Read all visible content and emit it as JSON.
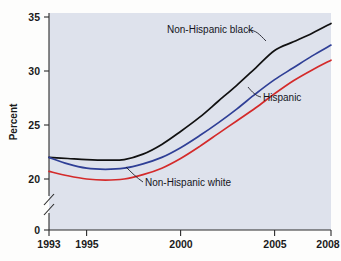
{
  "chart_data": {
    "type": "line",
    "title": "",
    "subtitle": "",
    "xlabel": "",
    "ylabel": "Percent",
    "x": [
      1993,
      1994,
      1995,
      1996,
      1997,
      1998,
      1999,
      2000,
      2001,
      2002,
      2003,
      2004,
      2005,
      2006,
      2007,
      2008
    ],
    "xlim": [
      1993,
      2008
    ],
    "ylim": [
      19.2,
      35
    ],
    "y_ticks": [
      0,
      20,
      25,
      30,
      35
    ],
    "y_tick_labels": [
      "0",
      "20",
      "25",
      "30",
      "35"
    ],
    "x_ticks": [
      1993,
      1995,
      2000,
      2005,
      2008
    ],
    "x_tick_labels": [
      "1993",
      "1995",
      "2000",
      "2005",
      "2008"
    ],
    "axis_break": true,
    "axis_break_note": "y-axis broken between 0 and 20",
    "grid": false,
    "legend_position": "inline-annotations",
    "series": [
      {
        "name": "Non-Hispanic black",
        "color": "#111111",
        "values": [
          22.0,
          21.9,
          21.8,
          21.75,
          21.8,
          22.3,
          23.2,
          24.4,
          25.7,
          27.2,
          28.7,
          30.3,
          31.9,
          32.7,
          33.5,
          34.4
        ]
      },
      {
        "name": "Non-Hispanic white",
        "color": "#2f3f96",
        "values": [
          22.0,
          21.4,
          21.0,
          20.9,
          21.0,
          21.4,
          22.0,
          22.9,
          24.0,
          25.2,
          26.5,
          27.9,
          29.2,
          30.3,
          31.4,
          32.4
        ]
      },
      {
        "name": "Hispanic",
        "color": "#d42a2a",
        "values": [
          20.7,
          20.3,
          20.0,
          19.9,
          20.0,
          20.4,
          21.0,
          21.9,
          23.0,
          24.2,
          25.4,
          26.6,
          27.9,
          29.1,
          30.1,
          31.0
        ]
      }
    ],
    "annotations": [
      {
        "text": "Non-Hispanic black",
        "target_series": "Non-Hispanic black"
      },
      {
        "text": "Hispanic",
        "target_series": "Hispanic"
      },
      {
        "text": "Non-Hispanic white",
        "target_series": "Non-Hispanic white"
      }
    ],
    "colors": {
      "plot_background": "#dee2ec",
      "figure_background": "#fdfdfc",
      "axis": "#2a2a2a",
      "non_hispanic_black": "#111111",
      "non_hispanic_white": "#2f3f96",
      "hispanic": "#d42a2a"
    }
  }
}
